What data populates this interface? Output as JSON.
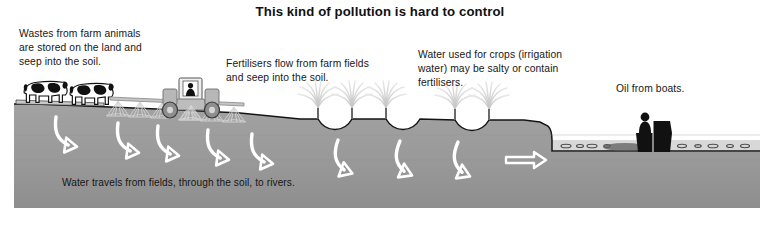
{
  "figure": {
    "title": "This kind of pollution is hard to control",
    "type": "cross-section-landscape-diagram"
  },
  "callouts": {
    "farm_animals": "Wastes from farm animals\nare stored on the land and\nseep into the soil.",
    "fertilisers": "Fertilisers flow from farm fields\nand seep into the soil.",
    "irrigation": "Water used for crops (irrigation\nwater) may be salty or contain\nfertilisers.",
    "oil": "Oil from boats.",
    "bottom_caption": "Water travels from fields, through the soil, to rivers."
  },
  "scene": {
    "elements": [
      {
        "name": "cow",
        "label": "dairy cow",
        "count": 2
      },
      {
        "name": "tractor",
        "label": "tractor with spray boom",
        "count": 1
      },
      {
        "name": "spray-boom",
        "label": "fertiliser spray boom",
        "count": 1
      },
      {
        "name": "spray-cone",
        "label": "fertiliser spray cone",
        "count": 7
      },
      {
        "name": "irrigation-sprinkler",
        "label": "irrigation sprinkler fountain",
        "count": 5
      },
      {
        "name": "furrow",
        "label": "irrigation furrow",
        "count": 4
      },
      {
        "name": "flow-arrow",
        "label": "water flow arrow through soil",
        "count": 10
      },
      {
        "name": "boat",
        "label": "motor boat with person",
        "count": 1
      },
      {
        "name": "oil-slick",
        "label": "oil droplets on water surface",
        "count": 11
      },
      {
        "name": "river",
        "label": "river water body",
        "count": 1
      }
    ]
  },
  "colors": {
    "background": "#ffffff",
    "soil": "#9b9b9b",
    "soil_shade": "#8f8f8f",
    "water": "#b4b4b4",
    "outline": "#111111",
    "arrow_stroke": "#ffffff",
    "spray": "#d2d2d2",
    "text": "#161616"
  }
}
